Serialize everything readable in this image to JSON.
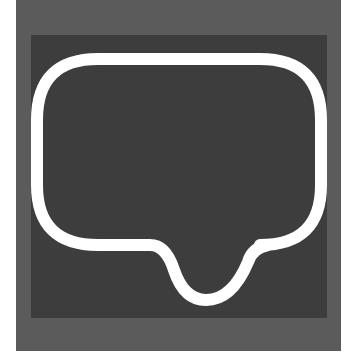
{
  "icon": {
    "name": "speech-bubble",
    "label": "Speech bubble icon",
    "colors": {
      "background": "#ffffff",
      "outer_frame": "#5b5b5b",
      "inner_square": "#3d3d3d",
      "bubble_stroke": "#ffffff",
      "bubble_fill": "#3d3d3d"
    }
  }
}
